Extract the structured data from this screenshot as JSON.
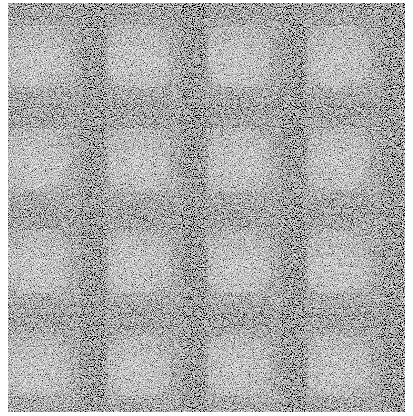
{
  "image": {
    "kind": "procedural-noise-texture",
    "description": "4x4 tiled grayscale plaid-like pattern with heavy speckle noise",
    "width": 397,
    "height": 409,
    "offset": {
      "x": 8,
      "y": 3
    },
    "tile": {
      "width": 100,
      "height": 103,
      "columns": 4,
      "rows": 4
    },
    "regions": {
      "light_square": {
        "x": 0,
        "y": 25,
        "w": 55,
        "h": 55,
        "gray": "#b8b8b8"
      },
      "dark_band_vertical": {
        "x": 74,
        "w": 24,
        "gray": "#1a1a1a"
      },
      "dark_band_top": {
        "y": 0,
        "h": 22,
        "gray": "#2a2a2a"
      },
      "mid_gray": "#6e6e6e"
    },
    "noise": {
      "type": "fractalNoise",
      "base_frequency": 0.9,
      "strength": 0.55
    },
    "background": "#ffffff"
  }
}
